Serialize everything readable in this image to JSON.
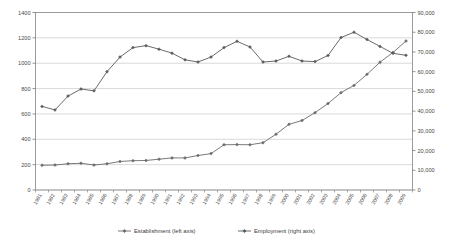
{
  "chart_data": {
    "type": "line",
    "title": "",
    "xlabel": "",
    "ylabel": "",
    "grid": true,
    "legend_position": "bottom",
    "categories": [
      "1981",
      "1982",
      "1983",
      "1984",
      "1985",
      "1986",
      "1987",
      "1988",
      "1989",
      "1990",
      "1991",
      "1992",
      "1993",
      "1994",
      "1995",
      "1996",
      "1997",
      "1998",
      "1999",
      "2000",
      "2001",
      "2002",
      "2003",
      "2004",
      "2005",
      "2006",
      "2007",
      "2008",
      "2009"
    ],
    "axes": {
      "left": {
        "label": "Establishment (left axis)",
        "ylim": [
          0,
          1400
        ],
        "tick_step": 200,
        "ticks": [
          "0",
          "200",
          "400",
          "600",
          "800",
          "1000",
          "1200",
          "1400"
        ]
      },
      "right": {
        "label": "Employment (right axis)",
        "ylim": [
          0,
          90000
        ],
        "tick_step": 10000,
        "ticks": [
          "0",
          "10,000",
          "20,000",
          "30,000",
          "40,000",
          "50,000",
          "60,000",
          "70,000",
          "80,000",
          "90,000"
        ]
      }
    },
    "series": [
      {
        "name": "Establishment  (left axis)",
        "axis": "left",
        "color": "#6b6b6b",
        "marker": "diamond",
        "values": [
          195,
          197,
          207,
          211,
          197,
          207,
          225,
          231,
          233,
          243,
          253,
          253,
          272,
          287,
          357,
          358,
          357,
          373,
          440,
          518,
          548,
          610,
          682,
          768,
          825,
          912,
          1008,
          1085,
          1175
        ]
      },
      {
        "name": "Employment  (right axis)",
        "axis": "right",
        "color": "#5a5a5a",
        "marker": "diamond",
        "values": [
          42400,
          40600,
          47600,
          51200,
          50300,
          60000,
          67400,
          72200,
          73200,
          71400,
          69400,
          66000,
          64900,
          67400,
          72200,
          75400,
          72500,
          64900,
          65400,
          67800,
          65400,
          65100,
          68200,
          77300,
          80000,
          76300,
          72800,
          69300,
          68300
        ]
      }
    ]
  },
  "legend": {
    "items": [
      {
        "label": "Establishment  (left axis)"
      },
      {
        "label": "Employment  (right axis)"
      }
    ]
  }
}
